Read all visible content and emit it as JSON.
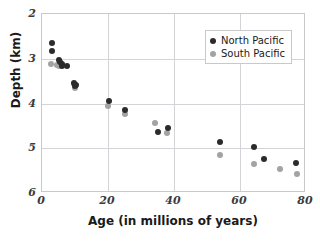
{
  "chart_data": {
    "type": "scatter",
    "title": "",
    "xlabel": "Age (in millions of years)",
    "ylabel": "Depth (km)",
    "xlim": [
      0,
      80
    ],
    "ylim": [
      2,
      6
    ],
    "y_inverted": true,
    "xticks": [
      "0",
      "20",
      "40",
      "60",
      "80"
    ],
    "xtick_values": [
      0,
      20,
      40,
      60,
      80
    ],
    "yticks": [
      "2",
      "3",
      "4",
      "5",
      "6"
    ],
    "ytick_values": [
      2,
      3,
      4,
      5,
      6
    ],
    "grid": true,
    "legend_position": "top-right",
    "series": [
      {
        "name": "North Pacific",
        "color": "#2b2b2b",
        "points": [
          {
            "x": 3.0,
            "y": 2.65
          },
          {
            "x": 3.0,
            "y": 2.83
          },
          {
            "x": 5.2,
            "y": 3.02
          },
          {
            "x": 5.6,
            "y": 3.08
          },
          {
            "x": 6.2,
            "y": 3.12
          },
          {
            "x": 6.0,
            "y": 3.16
          },
          {
            "x": 7.5,
            "y": 3.17
          },
          {
            "x": 9.8,
            "y": 3.55
          },
          {
            "x": 10.2,
            "y": 3.58
          },
          {
            "x": 10.0,
            "y": 3.62
          },
          {
            "x": 20.3,
            "y": 3.95
          },
          {
            "x": 25.3,
            "y": 4.14
          },
          {
            "x": 35.0,
            "y": 4.64
          },
          {
            "x": 38.2,
            "y": 4.55
          },
          {
            "x": 53.9,
            "y": 4.86
          },
          {
            "x": 64.3,
            "y": 4.97
          },
          {
            "x": 67.3,
            "y": 5.25
          },
          {
            "x": 77.0,
            "y": 5.34
          }
        ]
      },
      {
        "name": "South Pacific",
        "color": "#a3a3a3",
        "points": [
          {
            "x": 2.6,
            "y": 3.11
          },
          {
            "x": 4.6,
            "y": 3.14
          },
          {
            "x": 5.0,
            "y": 3.16
          },
          {
            "x": 5.4,
            "y": 3.13
          },
          {
            "x": 9.6,
            "y": 3.57
          },
          {
            "x": 9.9,
            "y": 3.66
          },
          {
            "x": 20.1,
            "y": 4.05
          },
          {
            "x": 25.1,
            "y": 4.24
          },
          {
            "x": 34.2,
            "y": 4.44
          },
          {
            "x": 38.0,
            "y": 4.66
          },
          {
            "x": 53.8,
            "y": 5.15
          },
          {
            "x": 64.1,
            "y": 5.35
          },
          {
            "x": 72.0,
            "y": 5.46
          },
          {
            "x": 77.2,
            "y": 5.57
          }
        ]
      }
    ]
  },
  "legend": {
    "entries": [
      {
        "label": "North Pacific",
        "marker": "dot-dark"
      },
      {
        "label": "South Pacific",
        "marker": "dot-gray"
      }
    ]
  },
  "colors": {
    "north_pacific": "#2b2b2b",
    "south_pacific": "#a3a3a3",
    "grid": "#d4d4d8",
    "frame": "#c9c9cc",
    "background": "#ffffff",
    "text": "#1a1a1a"
  }
}
